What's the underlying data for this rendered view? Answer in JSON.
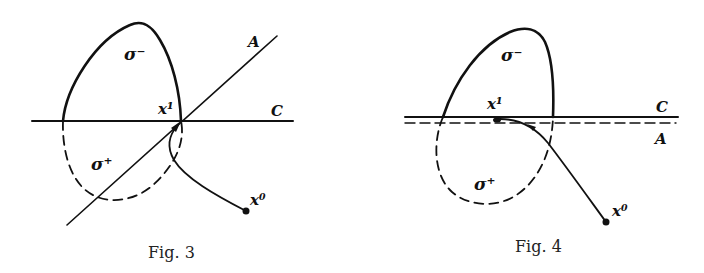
{
  "figures": [
    {
      "caption": "Fig. 3",
      "labels": {
        "sigma_minus": "σ⁻",
        "sigma_plus": "σ⁺",
        "line_a": "A",
        "line_c": "C",
        "x1": "x¹",
        "x0": "x⁰"
      },
      "description": "Line A crosses line C at x¹; solid boundary σ⁻ above C, dashed boundary σ⁺ below; trajectory from x⁰ reaches x¹"
    },
    {
      "caption": "Fig. 4",
      "labels": {
        "sigma_minus": "σ⁻",
        "sigma_plus": "σ⁺",
        "line_a": "A",
        "line_c": "C",
        "x1": "x¹",
        "x0": "x⁰"
      },
      "description": "Line A (dashed) runs parallel and just below line C; solid σ⁻ above, dashed σ⁺ below; trajectory from x⁰ reaches x¹ tangentially"
    }
  ],
  "colors": {
    "ink": "#111111",
    "background": "#ffffff"
  }
}
